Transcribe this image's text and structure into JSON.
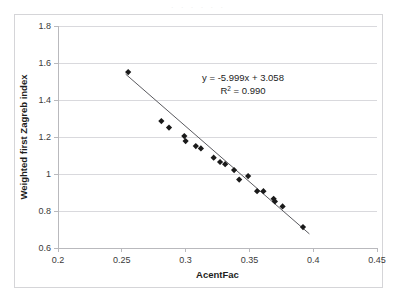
{
  "figure": {
    "top_artifact_text": ". . . . . .",
    "equation_label": "y = -5.999x + 3.058",
    "r2_label": "R² = 0.990"
  },
  "chart_data": {
    "type": "scatter",
    "title": "",
    "xlabel": "AcentFac",
    "ylabel": "Weighted first Zagreb index",
    "xlim": [
      0.2,
      0.45
    ],
    "ylim": [
      0.6,
      1.8
    ],
    "xticks": [
      0.2,
      0.25,
      0.3,
      0.35,
      0.4,
      0.45
    ],
    "xtick_labels": [
      "0.2",
      "0.25",
      "0.3",
      "0.35",
      "0.4",
      "0.45"
    ],
    "yticks": [
      0.6,
      0.8,
      1.0,
      1.2,
      1.4,
      1.6,
      1.8
    ],
    "ytick_labels": [
      "0.6",
      "0.8",
      "1",
      "1.2",
      "1.4",
      "1.6",
      "1.8"
    ],
    "grid": "horizontal",
    "legend": "none",
    "marker": "diamond",
    "marker_color": "#1a1a1a",
    "trendline": {
      "type": "linear",
      "slope": -5.999,
      "intercept": 3.058,
      "r2": 0.99,
      "equation": "y = -5.999x + 3.058",
      "r2_text": "R² = 0.990",
      "x_start": 0.253,
      "x_end": 0.397,
      "color": "#5a5a5f"
    },
    "annotations": [
      {
        "text": "y = -5.999x + 3.058",
        "x": 0.345,
        "y": 1.505
      },
      {
        "text": "R² = 0.990",
        "x": 0.345,
        "y": 1.435
      }
    ],
    "points": [
      {
        "x": 0.255,
        "y": 1.551
      },
      {
        "x": 0.281,
        "y": 1.286
      },
      {
        "x": 0.287,
        "y": 1.251
      },
      {
        "x": 0.299,
        "y": 1.205
      },
      {
        "x": 0.3,
        "y": 1.178
      },
      {
        "x": 0.308,
        "y": 1.151
      },
      {
        "x": 0.312,
        "y": 1.138
      },
      {
        "x": 0.322,
        "y": 1.088
      },
      {
        "x": 0.327,
        "y": 1.065
      },
      {
        "x": 0.331,
        "y": 1.053
      },
      {
        "x": 0.338,
        "y": 1.021
      },
      {
        "x": 0.342,
        "y": 0.97
      },
      {
        "x": 0.349,
        "y": 0.989
      },
      {
        "x": 0.356,
        "y": 0.907
      },
      {
        "x": 0.361,
        "y": 0.907
      },
      {
        "x": 0.369,
        "y": 0.866
      },
      {
        "x": 0.37,
        "y": 0.852
      },
      {
        "x": 0.376,
        "y": 0.825
      },
      {
        "x": 0.392,
        "y": 0.713
      }
    ]
  }
}
